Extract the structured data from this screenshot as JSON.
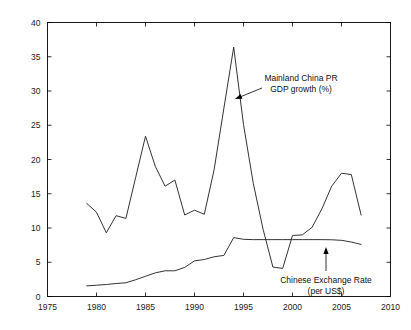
{
  "chart_data": {
    "type": "line",
    "title": "",
    "subtitle": "",
    "xlabel": "",
    "ylabel": "",
    "xlim": [
      1975,
      2010
    ],
    "ylim": [
      0,
      40
    ],
    "x_ticks": [
      1975,
      1980,
      1985,
      1990,
      1995,
      2000,
      2005,
      2010
    ],
    "x_tick_labels": [
      "1975",
      "1980",
      "1985",
      "1990",
      "1995",
      "2000",
      "2005",
      "2010"
    ],
    "y_ticks": [
      0,
      5,
      10,
      15,
      20,
      25,
      30,
      35,
      40
    ],
    "y_tick_labels": [
      "0",
      "5",
      "10",
      "15",
      "20",
      "25",
      "30",
      "35",
      "40"
    ],
    "grid": false,
    "legend_position": "none",
    "line_color": "#1c1c1c",
    "x": [
      1979,
      1980,
      1981,
      1982,
      1983,
      1984,
      1985,
      1986,
      1987,
      1988,
      1989,
      1990,
      1991,
      1992,
      1993,
      1994,
      1995,
      1996,
      1997,
      1998,
      1999,
      2000,
      2001,
      2002,
      2003,
      2004,
      2005,
      2006,
      2007
    ],
    "series": [
      {
        "name": "Mainland China PR GDP growth (%)",
        "units": "%",
        "values": [
          13.6,
          12.3,
          9.3,
          11.8,
          11.4,
          17.4,
          23.4,
          19.0,
          16.1,
          17.0,
          11.9,
          12.6,
          12.0,
          18.5,
          27.5,
          36.4,
          25.1,
          16.5,
          9.8,
          4.3,
          4.1,
          8.9,
          9.0,
          10.1,
          12.8,
          16.1,
          18.0,
          17.8,
          11.9
        ]
      },
      {
        "name": "Chinese Exchange Rate (per US$)",
        "units": "CNY per US$",
        "values": [
          1.55,
          1.65,
          1.75,
          1.9,
          2.0,
          2.45,
          2.95,
          3.45,
          3.75,
          3.75,
          4.25,
          5.2,
          5.4,
          5.8,
          6.0,
          8.6,
          8.35,
          8.3,
          8.3,
          8.3,
          8.3,
          8.3,
          8.3,
          8.3,
          8.3,
          8.28,
          8.2,
          7.95,
          7.6
        ]
      }
    ],
    "annotations": [
      {
        "name": "gdp-growth-annotation",
        "lines": [
          "Mainland China PR",
          "GDP growth (%)"
        ],
        "text_x": 301,
        "text_y": 81,
        "arrow_from_x": 262,
        "arrow_from_y": 88,
        "arrow_to_x": 235,
        "arrow_to_y": 99
      },
      {
        "name": "exchange-rate-annotation",
        "lines": [
          "Chinese Exchange Rate",
          "(per US$)"
        ],
        "text_x": 326,
        "text_y": 283,
        "arrow_from_x": 326,
        "arrow_from_y": 271,
        "arrow_to_x": 326,
        "arrow_to_y": 247
      }
    ]
  }
}
